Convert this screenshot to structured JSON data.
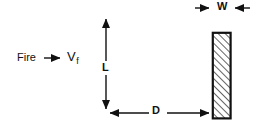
{
  "diagram": {
    "background_color": "#ffffff",
    "line_color": "#111111",
    "labels": {
      "fire": "Fire",
      "velocity_symbol": "V",
      "velocity_subscript": "f",
      "length": "L",
      "distance": "D",
      "width": "W"
    },
    "annotations": [
      {
        "name": "fire-flow-arrow",
        "icon": "arrow-right-icon",
        "meaning": "Fire spreads to the right with flame velocity V_f"
      },
      {
        "name": "length-dimension",
        "icon": "double-arrow-vertical-icon",
        "label": "L",
        "meaning": "Vertical flame length dimension, arrowheads at both ends"
      },
      {
        "name": "distance-dimension",
        "icon": "double-arrow-horizontal-icon",
        "label": "D",
        "meaning": "Horizontal separation distance from flame axis to target"
      },
      {
        "name": "width-dimension",
        "icon": "inward-arrows-icon",
        "label": "W",
        "meaning": "Thickness of the hatched target slab, arrows point inward"
      },
      {
        "name": "target-slab",
        "icon": "hatched-rectangle-icon",
        "meaning": "Cross-hatched vertical target member of width W"
      }
    ]
  },
  "geometry": {
    "canvas": {
      "width": 259,
      "height": 131
    },
    "fire_arrow": {
      "x1": 44,
      "x2": 63,
      "y": 58
    },
    "length_dim": {
      "x": 106,
      "y_top": 15,
      "y_bottom": 113,
      "gap_top": 61,
      "gap_bottom": 75
    },
    "distance_dim": {
      "y": 113,
      "x_left": 106,
      "x_right": 212,
      "gap_left": 149,
      "gap_right": 167
    },
    "width_dim": {
      "y": 8,
      "left_start": 195,
      "left_end": 211,
      "right_start": 250,
      "right_end": 233,
      "gap_left": 213,
      "gap_right": 231
    },
    "slab": {
      "x": 212,
      "y": 32,
      "width": 19,
      "height": 87,
      "border": 2.2,
      "hatch_spacing": 5,
      "hatch_angle": 45
    }
  }
}
